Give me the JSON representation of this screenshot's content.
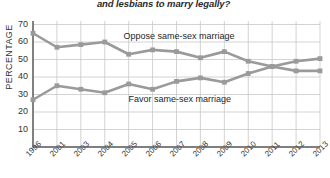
{
  "chart_data": {
    "type": "line",
    "title": "and lesbians to marry legally?",
    "xlabel": "",
    "ylabel": "PERCENTAGE",
    "categories": [
      "1996",
      "2001",
      "2003",
      "2004",
      "2005",
      "2006",
      "2007",
      "2008",
      "2009",
      "2010",
      "2011",
      "2012",
      "2013"
    ],
    "ylim": [
      0,
      72
    ],
    "yticks": [
      10,
      20,
      30,
      40,
      50,
      60,
      70
    ],
    "grid": true,
    "legend_position": "inline-annotation",
    "series": [
      {
        "name": "Oppose same-sex marriage",
        "color": "#9a9a9a",
        "marker": "square",
        "values": [
          65,
          57,
          58.5,
          60,
          53,
          55.5,
          54.5,
          51,
          54.5,
          49,
          46,
          43.5,
          43.5
        ]
      },
      {
        "name": "Favor same-sex marriage",
        "color": "#9a9a9a",
        "marker": "square",
        "values": [
          27,
          35,
          33,
          31,
          36,
          33,
          37.5,
          39.5,
          37,
          42,
          46,
          49,
          50.5
        ]
      }
    ],
    "annotations": [
      {
        "text": "Oppose same-sex marriage",
        "x_index": 6,
        "y_value": 63
      },
      {
        "text": "Favor same-sex marriage",
        "x_index": 6,
        "y_value": 27
      }
    ]
  },
  "colors": {
    "line": "#9a9a9a",
    "grid": "#c8c8c8",
    "axis": "#555555",
    "text": "#2b2b2b",
    "background": "#ffffff"
  }
}
